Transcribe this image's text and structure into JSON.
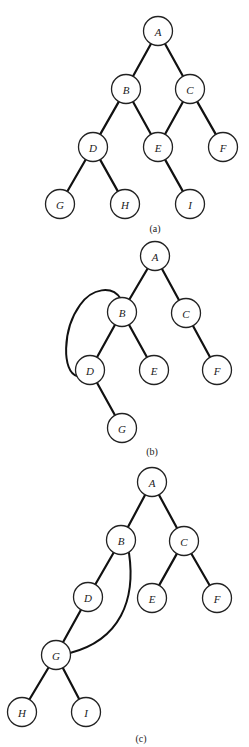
{
  "figures": [
    {
      "id": "a",
      "caption": "(a)",
      "caption_pos": [
        155,
        228
      ],
      "nodes": [
        {
          "id": "A",
          "label": "A",
          "x": 158,
          "y": 31
        },
        {
          "id": "B",
          "label": "B",
          "x": 126,
          "y": 89
        },
        {
          "id": "C",
          "label": "C",
          "x": 190,
          "y": 89
        },
        {
          "id": "D",
          "label": "D",
          "x": 93,
          "y": 147
        },
        {
          "id": "E",
          "label": "E",
          "x": 158,
          "y": 147
        },
        {
          "id": "F",
          "label": "F",
          "x": 223,
          "y": 147
        },
        {
          "id": "G",
          "label": "G",
          "x": 60,
          "y": 204
        },
        {
          "id": "H",
          "label": "H",
          "x": 125,
          "y": 204
        },
        {
          "id": "I",
          "label": "I",
          "x": 190,
          "y": 204
        }
      ],
      "edges": [
        [
          "A",
          "B"
        ],
        [
          "A",
          "C"
        ],
        [
          "B",
          "D"
        ],
        [
          "B",
          "E"
        ],
        [
          "C",
          "E"
        ],
        [
          "C",
          "F"
        ],
        [
          "D",
          "G"
        ],
        [
          "D",
          "H"
        ],
        [
          "E",
          "I"
        ]
      ],
      "arcs": []
    },
    {
      "id": "b",
      "caption": "(b)",
      "caption_pos": [
        152,
        451
      ],
      "nodes": [
        {
          "id": "A",
          "label": "A",
          "x": 155,
          "y": 256
        },
        {
          "id": "B",
          "label": "B",
          "x": 122,
          "y": 312
        },
        {
          "id": "C",
          "label": "C",
          "x": 186,
          "y": 313
        },
        {
          "id": "D",
          "label": "D",
          "x": 90,
          "y": 370
        },
        {
          "id": "E",
          "label": "E",
          "x": 154,
          "y": 370
        },
        {
          "id": "F",
          "label": "F",
          "x": 217,
          "y": 370
        },
        {
          "id": "G",
          "label": "G",
          "x": 122,
          "y": 428
        }
      ],
      "edges": [
        [
          "A",
          "B"
        ],
        [
          "A",
          "C"
        ],
        [
          "B",
          "D"
        ],
        [
          "B",
          "E"
        ],
        [
          "C",
          "F"
        ],
        [
          "D",
          "G"
        ]
      ],
      "arcs": [
        {
          "from": "B",
          "to": "D",
          "path": "M 121 299 C 112 285, 92 288, 80 305 C 62 330, 62 372, 77 376"
        }
      ]
    },
    {
      "id": "c",
      "caption": "(c)",
      "caption_pos": [
        141,
        738
      ],
      "nodes": [
        {
          "id": "A",
          "label": "A",
          "x": 152,
          "y": 482
        },
        {
          "id": "B",
          "label": "B",
          "x": 121,
          "y": 540
        },
        {
          "id": "C",
          "label": "C",
          "x": 184,
          "y": 541
        },
        {
          "id": "D",
          "label": "D",
          "x": 88,
          "y": 597
        },
        {
          "id": "E",
          "label": "E",
          "x": 152,
          "y": 598
        },
        {
          "id": "F",
          "label": "F",
          "x": 217,
          "y": 598
        },
        {
          "id": "G",
          "label": "G",
          "x": 56,
          "y": 655
        },
        {
          "id": "H",
          "label": "H",
          "x": 22,
          "y": 712
        },
        {
          "id": "I",
          "label": "I",
          "x": 86,
          "y": 712
        }
      ],
      "edges": [
        [
          "A",
          "B"
        ],
        [
          "A",
          "C"
        ],
        [
          "B",
          "D"
        ],
        [
          "C",
          "E"
        ],
        [
          "C",
          "F"
        ],
        [
          "D",
          "G"
        ],
        [
          "G",
          "H"
        ],
        [
          "G",
          "I"
        ]
      ],
      "arcs": [
        {
          "from": "B",
          "to": "G",
          "path": "M 129 553 C 136 600, 120 640, 70 653"
        }
      ]
    }
  ],
  "style": {
    "node_radius": 14.5,
    "stroke_color": "#111111",
    "background": "#ffffff"
  }
}
